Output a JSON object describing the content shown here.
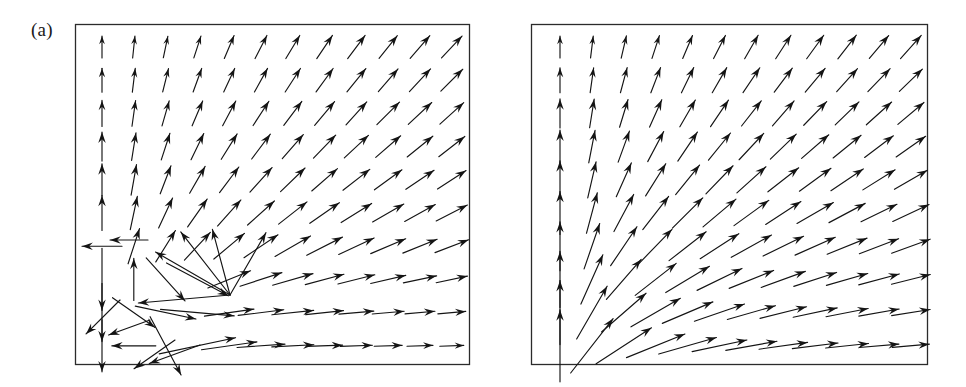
{
  "figure": {
    "type": "vector-field-figure",
    "width": 966,
    "height": 387,
    "background": "#ffffff",
    "ink_color": "#141414",
    "frame_color": "#2b2b2b"
  },
  "panels": [
    {
      "id": "a",
      "label": "(a)",
      "frame": {
        "x": 75,
        "y": 24,
        "width": 395,
        "height": 341
      },
      "grid": {
        "cols": 12,
        "rows": 10,
        "x0": 102,
        "y0": 47,
        "dx": 31.8,
        "dy": 33.2
      },
      "description": "vector field with singular / chaotic region in lower-left quadrant"
    },
    {
      "id": "b",
      "label": "(b)",
      "frame": {
        "x": 531,
        "y": 24,
        "width": 397,
        "height": 341
      },
      "grid": {
        "cols": 12,
        "rows": 10,
        "x0": 560,
        "y0": 47,
        "dx": 31.9,
        "dy": 33.2
      },
      "description": "smooth radial vector field rotating from vertical at left edge to horizontal at bottom edge"
    }
  ],
  "chart_data": {
    "type": "scatter",
    "title": "",
    "subtitle": "",
    "xlabel": "",
    "ylabel": "",
    "grid": false,
    "legend": null,
    "panel_labels": [
      "(a)",
      "(b)"
    ],
    "field_model": {
      "note": "Arrow direction angle measured in degrees counter-clockwise from +x axis. Arrow length in pixels.",
      "panel_a_base_angle_deg_by_col_row": "smooth field: angle = atan2(col_index+0.55, row_from_bottom+0.55) style radial fan, vertical at left column, horizontal at bottom row",
      "panel_b_base_angle_deg_by_col_row": "same smooth radial fan as panel a, without perturbation"
    },
    "panel_a": {
      "cols": 12,
      "rows": 10,
      "angles_deg": [
        [
          90,
          84,
          78,
          72,
          67,
          63,
          59,
          56,
          53,
          51,
          49,
          47
        ],
        [
          90,
          83,
          76,
          70,
          65,
          61,
          57,
          54,
          51,
          49,
          47,
          45
        ],
        [
          90,
          82,
          74,
          67,
          62,
          57,
          53,
          50,
          48,
          45,
          43,
          42
        ],
        [
          90,
          81,
          72,
          64,
          58,
          53,
          49,
          46,
          43,
          41,
          39,
          38
        ],
        [
          90,
          80,
          69,
          60,
          53,
          48,
          44,
          41,
          38,
          36,
          34,
          33
        ],
        [
          90,
          78,
          65,
          55,
          48,
          42,
          38,
          35,
          32,
          30,
          29,
          27
        ],
        [
          180,
          72,
          58,
          47,
          40,
          34,
          30,
          27,
          25,
          23,
          22,
          21
        ],
        [
          270,
          90,
          -48,
          -28,
          22,
          18,
          16,
          15,
          14,
          13,
          12,
          12
        ],
        [
          270,
          -35,
          -12,
          -5,
          8,
          7,
          6,
          6,
          5,
          5,
          5,
          5
        ],
        [
          270,
          180,
          -62,
          12,
          8,
          4,
          3,
          2,
          2,
          2,
          2,
          2
        ]
      ],
      "lengths_px": [
        [
          22,
          22,
          22,
          23,
          25,
          26,
          27,
          28,
          29,
          29,
          30,
          30
        ],
        [
          24,
          24,
          24,
          25,
          26,
          27,
          28,
          29,
          30,
          30,
          31,
          31
        ],
        [
          26,
          26,
          26,
          27,
          28,
          29,
          30,
          31,
          31,
          32,
          32,
          32
        ],
        [
          29,
          28,
          28,
          29,
          30,
          31,
          32,
          32,
          33,
          33,
          33,
          33
        ],
        [
          32,
          31,
          30,
          31,
          32,
          33,
          34,
          34,
          34,
          34,
          34,
          34
        ],
        [
          35,
          34,
          33,
          34,
          35,
          36,
          36,
          36,
          36,
          36,
          35,
          35
        ],
        [
          40,
          37,
          37,
          38,
          40,
          41,
          41,
          40,
          39,
          38,
          37,
          36
        ],
        [
          62,
          42,
          58,
          70,
          46,
          44,
          42,
          40,
          38,
          36,
          34,
          32
        ],
        [
          58,
          52,
          62,
          74,
          50,
          46,
          42,
          38,
          35,
          32,
          30,
          28
        ],
        [
          52,
          44,
          66,
          78,
          56,
          48,
          42,
          36,
          32,
          28,
          26,
          24
        ]
      ],
      "extra_arrows": [
        {
          "x": 148,
          "y": 240,
          "angle_deg": 180,
          "length": 38,
          "note": "leftward arrow at mid-left"
        },
        {
          "x": 120,
          "y": 300,
          "angle_deg": 225,
          "length": 48
        },
        {
          "x": 150,
          "y": 320,
          "angle_deg": 200,
          "length": 44
        },
        {
          "x": 230,
          "y": 295,
          "angle_deg": 185,
          "length": 92,
          "note": "long converging arrow toward node"
        },
        {
          "x": 230,
          "y": 295,
          "angle_deg": 150,
          "length": 86
        },
        {
          "x": 230,
          "y": 295,
          "angle_deg": 128,
          "length": 80
        },
        {
          "x": 230,
          "y": 295,
          "angle_deg": 60,
          "length": 72
        },
        {
          "x": 230,
          "y": 295,
          "angle_deg": 105,
          "length": 68
        },
        {
          "x": 175,
          "y": 340,
          "angle_deg": 215,
          "length": 50
        },
        {
          "x": 200,
          "y": 345,
          "angle_deg": 200,
          "length": 54
        }
      ]
    },
    "panel_b": {
      "cols": 12,
      "rows": 10,
      "angles_deg": [
        [
          90,
          83,
          77,
          72,
          67,
          63,
          60,
          57,
          54,
          52,
          50,
          48
        ],
        [
          90,
          82,
          75,
          69,
          64,
          60,
          56,
          53,
          50,
          48,
          46,
          44
        ],
        [
          90,
          81,
          73,
          66,
          60,
          56,
          52,
          49,
          46,
          44,
          42,
          40
        ],
        [
          90,
          79,
          70,
          62,
          56,
          51,
          47,
          44,
          41,
          39,
          37,
          35
        ],
        [
          90,
          77,
          66,
          58,
          51,
          46,
          42,
          38,
          36,
          34,
          32,
          30
        ],
        [
          90,
          75,
          62,
          52,
          45,
          40,
          36,
          33,
          30,
          28,
          26,
          25
        ],
        [
          90,
          71,
          56,
          46,
          38,
          33,
          29,
          26,
          24,
          22,
          21,
          20
        ],
        [
          90,
          66,
          49,
          38,
          31,
          26,
          22,
          20,
          18,
          16,
          15,
          14
        ],
        [
          90,
          60,
          41,
          30,
          23,
          19,
          16,
          14,
          12,
          11,
          10,
          9
        ],
        [
          90,
          52,
          33,
          22,
          16,
          12,
          10,
          8,
          7,
          6,
          5,
          5
        ]
      ],
      "lengths_px": [
        [
          22,
          22,
          23,
          24,
          25,
          26,
          27,
          28,
          29,
          30,
          30,
          31
        ],
        [
          25,
          25,
          26,
          27,
          28,
          29,
          30,
          30,
          31,
          31,
          32,
          32
        ],
        [
          29,
          29,
          29,
          30,
          31,
          32,
          32,
          33,
          33,
          33,
          34,
          34
        ],
        [
          33,
          33,
          33,
          34,
          35,
          35,
          36,
          36,
          36,
          36,
          36,
          36
        ],
        [
          38,
          37,
          37,
          38,
          38,
          39,
          39,
          39,
          39,
          39,
          38,
          38
        ],
        [
          43,
          42,
          42,
          42,
          43,
          43,
          43,
          42,
          42,
          41,
          40,
          40
        ],
        [
          49,
          48,
          47,
          47,
          47,
          46,
          46,
          45,
          44,
          43,
          42,
          41
        ],
        [
          56,
          54,
          53,
          52,
          51,
          50,
          48,
          47,
          45,
          43,
          42,
          40
        ],
        [
          64,
          61,
          59,
          57,
          55,
          53,
          50,
          48,
          45,
          43,
          41,
          39
        ],
        [
          72,
          69,
          66,
          63,
          60,
          56,
          52,
          49,
          46,
          43,
          40,
          37
        ]
      ],
      "extra_arrows": []
    }
  }
}
